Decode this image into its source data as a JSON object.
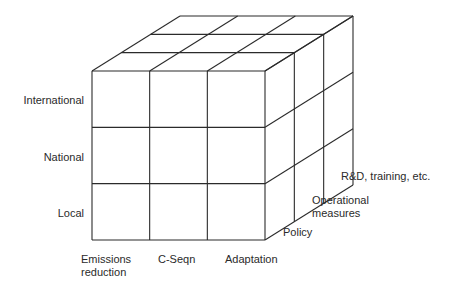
{
  "diagram": {
    "type": "3d-cube-matrix",
    "grid": {
      "columns": 3,
      "rows": 3,
      "depth": 3
    },
    "line_color": "#2b2b2b",
    "row_labels": [
      "International",
      "National",
      "Local"
    ],
    "column_labels": [
      {
        "line1": "Emissions",
        "line2": "reduction"
      },
      {
        "line1": "C-Seqn",
        "line2": ""
      },
      {
        "line1": "Adaptation",
        "line2": ""
      }
    ],
    "depth_labels": [
      {
        "line1": "Policy",
        "line2": ""
      },
      {
        "line1": "Operational",
        "line2": "measures"
      },
      {
        "line1": "R&D, training, etc.",
        "line2": ""
      }
    ]
  }
}
